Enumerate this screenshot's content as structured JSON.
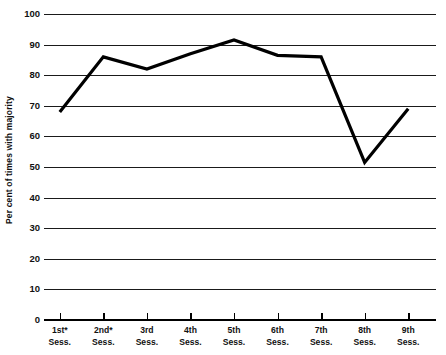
{
  "chart_data": {
    "type": "line",
    "title": "",
    "xlabel": "",
    "ylabel": "Per cent of times with majority",
    "categories": [
      "1st* Sess.",
      "2nd* Sess.",
      "3rd Sess.",
      "4th Sess.",
      "5th Sess.",
      "6th Sess.",
      "7th Sess.",
      "8th Sess.",
      "9th Sess."
    ],
    "category_lines": [
      {
        "line1": "1st*",
        "line2": "Sess."
      },
      {
        "line1": "2nd*",
        "line2": "Sess."
      },
      {
        "line1": "3rd",
        "line2": "Sess."
      },
      {
        "line1": "4th",
        "line2": "Sess."
      },
      {
        "line1": "5th",
        "line2": "Sess."
      },
      {
        "line1": "6th",
        "line2": "Sess."
      },
      {
        "line1": "7th",
        "line2": "Sess."
      },
      {
        "line1": "8th",
        "line2": "Sess."
      },
      {
        "line1": "9th",
        "line2": "Sess."
      }
    ],
    "values": [
      68,
      86,
      82,
      87,
      91.5,
      86.5,
      86,
      51.5,
      69
    ],
    "ylim": [
      0,
      100
    ],
    "yticks": [
      100,
      90,
      80,
      70,
      60,
      50,
      40,
      30,
      20,
      10,
      0
    ],
    "ytick_labels": [
      "100",
      "90",
      "80",
      "70",
      "60",
      "50",
      "40",
      "30",
      "20",
      "10",
      "0"
    ],
    "grid": true,
    "legend": "none",
    "line_color": "#000000",
    "grid_color": "#1a1a1a",
    "background_color": "#ffffff"
  }
}
